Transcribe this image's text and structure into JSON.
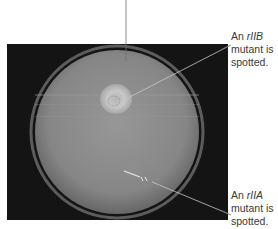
{
  "figure": {
    "labels": [
      {
        "id": "rIIB",
        "prefix": "An ",
        "gene": "rIIB",
        "line2": "mutant is",
        "line3": "spotted."
      },
      {
        "id": "rIIA",
        "prefix": "An ",
        "gene": "rIIA",
        "line2": "mutant is",
        "line3": "spotted."
      }
    ],
    "colors": {
      "background": "#ffffff",
      "photo_background": "#141414",
      "plate": "#8a8a8a",
      "spot": "#c4c4c4",
      "leader_line": "#6e6e6e",
      "label_text": "#3a3a3a"
    }
  }
}
